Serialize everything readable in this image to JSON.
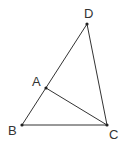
{
  "diagram": {
    "type": "geometry",
    "line_color": "#333333",
    "points": [
      {
        "name": "D",
        "x": 87,
        "y": 24,
        "label_x": 84,
        "label_y": 18
      },
      {
        "name": "A",
        "x": 46,
        "y": 88,
        "label_x": 32,
        "label_y": 86
      },
      {
        "name": "B",
        "x": 22,
        "y": 125,
        "label_x": 8,
        "label_y": 135
      },
      {
        "name": "C",
        "x": 107,
        "y": 125,
        "label_x": 109,
        "label_y": 139
      }
    ],
    "segments": [
      [
        "B",
        "D"
      ],
      [
        "D",
        "C"
      ],
      [
        "B",
        "C"
      ],
      [
        "A",
        "C"
      ]
    ],
    "labels": {
      "D": "D",
      "A": "A",
      "B": "B",
      "C": "C"
    }
  }
}
